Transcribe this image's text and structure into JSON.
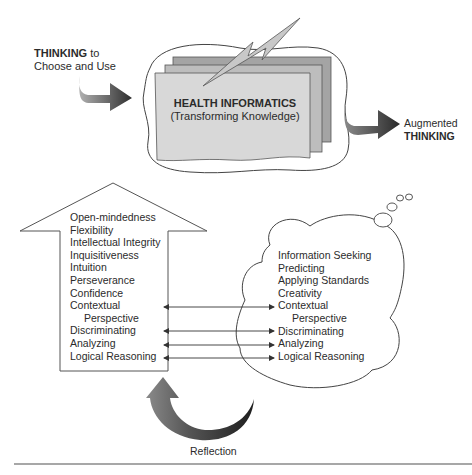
{
  "input_label": {
    "bold": "THINKING",
    "rest": " to",
    "line2": "Choose and Use"
  },
  "center_box": {
    "title": "HEALTH INFORMATICS",
    "subtitle": "(Transforming Knowledge)"
  },
  "output_label": {
    "line1": "Augmented",
    "line2": "THINKING"
  },
  "left_arrow_list": {
    "items": [
      "Open-mindedness",
      "Flexibility",
      "Intellectual Integrity",
      "Inquisitiveness",
      "Intuition",
      "Perseverance",
      "Confidence",
      "Contextual",
      "Perspective",
      "Discriminating",
      "Analyzing",
      "Logical Reasoning"
    ]
  },
  "right_cloud_list": {
    "items": [
      "Information Seeking",
      "Predicting",
      "Applying Standards",
      "Creativity",
      "Contextual",
      "Perspective",
      "Discriminating",
      "Analyzing",
      "Logical Reasoning"
    ]
  },
  "connectors": {
    "linked_pairs": [
      "Contextual Perspective",
      "Discriminating",
      "Analyzing",
      "Logical Reasoning"
    ],
    "style": "double-headed-arrow"
  },
  "reflection_label": "Reflection",
  "colors": {
    "sheet_front": "#d9d9d9",
    "sheet_mid": "#b8b8b8",
    "sheet_back": "#a0a0a0",
    "arrow_dark": "#3a3a3a",
    "arrow_light": "#9a9a9a",
    "line": "#555555"
  }
}
